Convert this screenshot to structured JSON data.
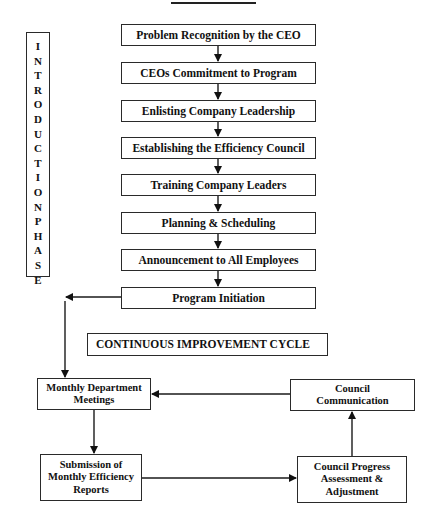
{
  "diagram": {
    "title_underline": true,
    "intro_phase": {
      "label": "INTRODUCTION PHASE",
      "letters": [
        "I",
        "N",
        "T",
        "R",
        "O",
        "D",
        "U",
        "C",
        "T",
        "I",
        "O",
        "N",
        "",
        "P",
        "H",
        "A",
        "S",
        "E"
      ]
    },
    "steps": [
      {
        "label": "Problem Recognition by the CEO"
      },
      {
        "label": "CEOs Commitment to Program"
      },
      {
        "label": "Enlisting Company Leadership"
      },
      {
        "label": "Establishing the Efficiency Council"
      },
      {
        "label": "Training Company Leaders"
      },
      {
        "label": "Planning & Scheduling"
      },
      {
        "label": "Announcement to All Employees"
      },
      {
        "label": "Program Initiation"
      }
    ],
    "cycle_header": "CONTINUOUS IMPROVEMENT CYCLE",
    "cycle": {
      "monthly_meetings": {
        "line1": "Monthly Department",
        "line2": "Meetings"
      },
      "submission": {
        "line1": "Submission of",
        "line2": "Monthly Efficiency",
        "line3": "Reports"
      },
      "council_progress": {
        "line1": "Council Progress",
        "line2": "Assessment &",
        "line3": "Adjustment"
      },
      "council_communication": {
        "line1": "Council",
        "line2": "Communication"
      }
    },
    "colors": {
      "line": "#1a1a1a",
      "box_border": "#2a2a2a",
      "background": "#ffffff"
    }
  }
}
